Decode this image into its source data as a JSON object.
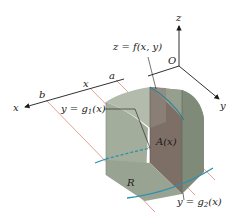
{
  "figure": {
    "axes": {
      "x_label": "x",
      "y_label": "y",
      "z_label": "z",
      "origin_label": "O"
    },
    "x_axis_marks": {
      "b": "b",
      "x": "x",
      "a": "a"
    },
    "labels": {
      "surface": "z = f(x, y)",
      "lower_curve_prefix": "y = g",
      "lower_curve_sub": "1",
      "lower_curve_suffix": "(x)",
      "upper_curve_prefix": "y = g",
      "upper_curve_sub": "2",
      "upper_curve_suffix": "(x)",
      "cross_section": "A(x)",
      "region": "R"
    },
    "colors": {
      "solid_light": "#a9b3a2",
      "solid_mid": "#8e9a87",
      "solid_dark": "#6f7a69",
      "slice": "#7d6e66",
      "curve": "#2f8fb3",
      "guide_line": "#d98a7a",
      "axis": "#1a1a1a"
    }
  }
}
